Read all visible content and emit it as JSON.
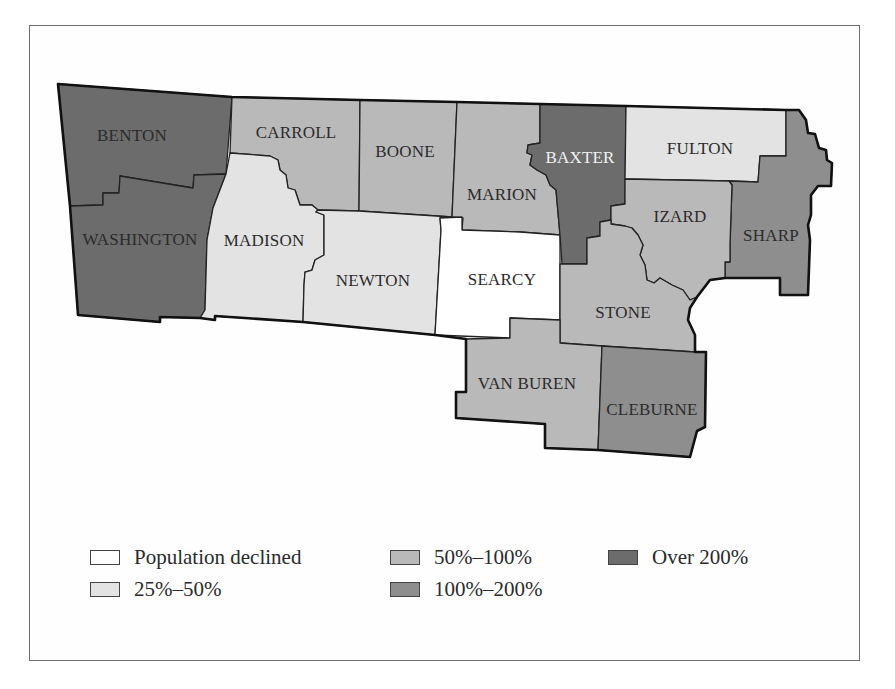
{
  "map": {
    "type": "choropleth",
    "subject": "Population change by county",
    "colors": {
      "declined": "#ffffff",
      "25_50": "#e3e3e3",
      "50_100": "#b9b9b9",
      "100_200": "#8e8e8e",
      "over_200": "#6c6c6c"
    },
    "counties": [
      {
        "name": "BENTON",
        "category": "Over 200%"
      },
      {
        "name": "WASHINGTON",
        "category": "Over 200%"
      },
      {
        "name": "CARROLL",
        "category": "50%–100%"
      },
      {
        "name": "MADISON",
        "category": "25%–50%"
      },
      {
        "name": "BOONE",
        "category": "50%–100%"
      },
      {
        "name": "NEWTON",
        "category": "25%–50%"
      },
      {
        "name": "MARION",
        "category": "50%–100%"
      },
      {
        "name": "SEARCY",
        "category": "Population declined"
      },
      {
        "name": "BAXTER",
        "category": "Over 200%"
      },
      {
        "name": "FULTON",
        "category": "25%–50%"
      },
      {
        "name": "IZARD",
        "category": "50%–100%"
      },
      {
        "name": "SHARP",
        "category": "100%–200%"
      },
      {
        "name": "STONE",
        "category": "50%–100%"
      },
      {
        "name": "VAN BUREN",
        "category": "50%–100%"
      },
      {
        "name": "CLEBURNE",
        "category": "100%–200%"
      }
    ]
  },
  "legend": {
    "items": [
      {
        "label": "Population declined",
        "color": "#ffffff"
      },
      {
        "label": "25%–50%",
        "color": "#e3e3e3"
      },
      {
        "label": "50%–100%",
        "color": "#b9b9b9"
      },
      {
        "label": "100%–200%",
        "color": "#8e8e8e"
      },
      {
        "label": "Over 200%",
        "color": "#6c6c6c"
      }
    ]
  }
}
